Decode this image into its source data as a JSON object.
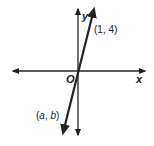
{
  "diagram": {
    "type": "coordinate-plane",
    "axes": {
      "x_label": "x",
      "y_label": "y",
      "origin_label": "O"
    },
    "line": {
      "description": "line through the origin with positive slope",
      "points": [
        {
          "label": "(1, 4)",
          "x": 1,
          "y": 4
        },
        {
          "label": "(a, b)",
          "x": "a",
          "y": "b"
        }
      ]
    },
    "point_labels": {
      "upper": "(1, 4)",
      "lower_prefix": "(",
      "lower_a": "a",
      "lower_sep": ", ",
      "lower_b": "b",
      "lower_suffix": ")"
    },
    "colors": {
      "stroke": "#222222",
      "background": "#ffffff"
    }
  }
}
